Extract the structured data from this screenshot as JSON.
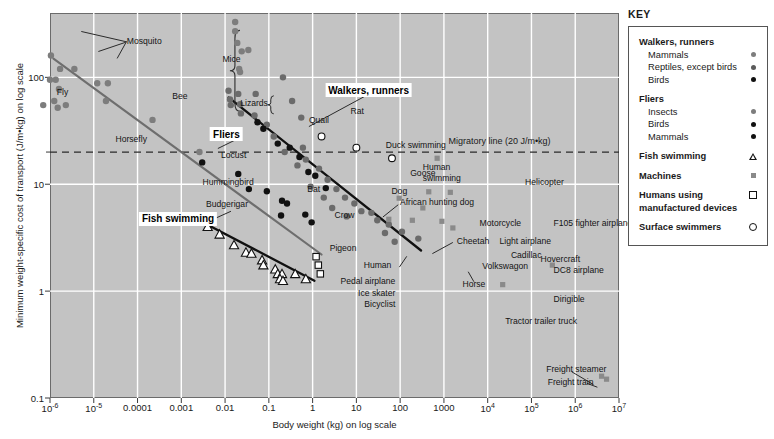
{
  "chart_data": {
    "type": "scatter",
    "title": "",
    "xlabel": "Body weight (kg) on log scale",
    "ylabel": "Minimum weight-specific cost of transport (J/m•kg) on log scale",
    "xscale": "log",
    "yscale": "log",
    "xlim": [
      1e-06,
      10000000.0
    ],
    "ylim": [
      0.1,
      400
    ],
    "grid": true,
    "legend_position": "right-outside",
    "xticks": [
      {
        "value": 1e-06,
        "label": "10",
        "exp": "-6"
      },
      {
        "value": 1e-05,
        "label": "10",
        "exp": "-5"
      },
      {
        "value": 0.0001,
        "label": "0.0001",
        "exp": ""
      },
      {
        "value": 0.001,
        "label": "0.001",
        "exp": ""
      },
      {
        "value": 0.01,
        "label": "0.01",
        "exp": ""
      },
      {
        "value": 0.1,
        "label": "0.1",
        "exp": ""
      },
      {
        "value": 1,
        "label": "1",
        "exp": ""
      },
      {
        "value": 10,
        "label": "10",
        "exp": ""
      },
      {
        "value": 100,
        "label": "100",
        "exp": ""
      },
      {
        "value": 1000,
        "label": "1000",
        "exp": ""
      },
      {
        "value": 10000,
        "label": "10",
        "exp": "4"
      },
      {
        "value": 100000,
        "label": "10",
        "exp": "5"
      },
      {
        "value": 1000000,
        "label": "10",
        "exp": "6"
      },
      {
        "value": 10000000,
        "label": "10",
        "exp": "7"
      }
    ],
    "yticks": [
      {
        "value": 100,
        "label": "100"
      },
      {
        "value": 10,
        "label": "10"
      },
      {
        "value": 1,
        "label": "1"
      },
      {
        "value": 0.1,
        "label": "0.1"
      }
    ],
    "reference_lines": [
      {
        "name": "migratory-line",
        "value": 20,
        "label": "Migratory line (20 J/m•kg)",
        "style": "dashed",
        "orientation": "horizontal"
      }
    ],
    "trend_lines": [
      {
        "name": "fliers",
        "label": "Fliers",
        "color": "#6e6e6e",
        "x": [
          1.2e-06,
          1.6
        ],
        "y": [
          150,
          2.2
        ]
      },
      {
        "name": "walkers-runners",
        "label": "Walkers, runners",
        "color": "#111111",
        "x": [
          0.012,
          300
        ],
        "y": [
          65,
          2.4
        ]
      },
      {
        "name": "fish-swimming",
        "label": "Fish swimming",
        "color": "#111111",
        "x": [
          0.0035,
          1.1
        ],
        "y": [
          4.3,
          1.25
        ]
      }
    ],
    "series": [
      {
        "name": "Fliers – insects",
        "symbol": "filled-circle-gray",
        "color": "#7d7d7d",
        "points": [
          [
            1.05e-06,
            160
          ],
          [
            1.7e-06,
            120
          ],
          [
            3.6e-06,
            120
          ],
          [
            1e-06,
            95
          ],
          [
            1.35e-06,
            95
          ],
          [
            1.6e-06,
            78
          ],
          [
            1.25e-06,
            60
          ],
          [
            1.5e-06,
            52
          ],
          [
            2.3e-06,
            55
          ],
          [
            7e-07,
            55
          ],
          [
            1.2e-05,
            88
          ],
          [
            2.1e-05,
            88
          ],
          [
            1.9e-05,
            60
          ],
          [
            0.00022,
            40
          ],
          [
            0.0026,
            20
          ]
        ]
      },
      {
        "name": "Fliers – birds",
        "symbol": "filled-circle-black",
        "color": "#111111",
        "points": [
          [
            0.003,
            16
          ],
          [
            0.035,
            9.0
          ],
          [
            0.09,
            8.6
          ],
          [
            0.2,
            7.0
          ],
          [
            0.26,
            6.6
          ],
          [
            0.19,
            5.1
          ],
          [
            0.68,
            5.2
          ],
          [
            0.95,
            4.4
          ]
        ]
      },
      {
        "name": "Fliers – mammals (bat)",
        "symbol": "filled-circle-black",
        "color": "#111111",
        "points": [
          [
            0.02,
            12.5
          ]
        ]
      },
      {
        "name": "Walkers/runners – mammals (mice cluster)",
        "symbol": "filled-circle-gray",
        "color": "#7d7d7d",
        "points": [
          [
            0.017,
            330
          ],
          [
            0.017,
            270
          ],
          [
            0.019,
            210
          ],
          [
            0.024,
            175
          ],
          [
            0.034,
            180
          ],
          [
            0.021,
            120
          ],
          [
            0.022,
            112
          ]
        ]
      },
      {
        "name": "Walkers/runners – reptiles/lizards",
        "symbol": "filled-circle-gray",
        "color": "#6b6b6b",
        "points": [
          [
            0.012,
            75
          ],
          [
            0.013,
            62
          ],
          [
            0.0135,
            55
          ],
          [
            0.02,
            70
          ],
          [
            0.022,
            56
          ],
          [
            0.023,
            46
          ],
          [
            0.05,
            70
          ],
          [
            0.047,
            44
          ],
          [
            0.09,
            36
          ],
          [
            0.21,
            100
          ],
          [
            0.34,
            60
          ],
          [
            0.13,
            28
          ],
          [
            0.55,
            42
          ],
          [
            0.23,
            20
          ],
          [
            0.6,
            22
          ],
          [
            0.7,
            17
          ],
          [
            1.4,
            14
          ],
          [
            0.9,
            9.5
          ],
          [
            2.2,
            11
          ],
          [
            3.5,
            9.0
          ],
          [
            5.5,
            7.5
          ],
          [
            9,
            6.6
          ],
          [
            13,
            5.6
          ],
          [
            30,
            4.6
          ],
          [
            55,
            4.2
          ],
          [
            110,
            3.6
          ],
          [
            260,
            3.1
          ],
          [
            0.45,
            15
          ],
          [
            1.8,
            7.5
          ],
          [
            6,
            5.0
          ],
          [
            22,
            5.4
          ],
          [
            2.8,
            6.0
          ],
          [
            45,
            3.5
          ],
          [
            75,
            2.9
          ]
        ]
      },
      {
        "name": "Walkers/runners – birds",
        "symbol": "filled-circle-black",
        "color": "#111111",
        "points": [
          [
            0.055,
            38
          ],
          [
            0.075,
            33
          ],
          [
            0.16,
            24
          ],
          [
            0.3,
            22
          ],
          [
            0.5,
            18
          ],
          [
            0.8,
            13
          ],
          [
            1.15,
            12
          ],
          [
            2.0,
            9.2
          ]
        ]
      },
      {
        "name": "Fish swimming",
        "symbol": "open-triangle",
        "color": "#111111",
        "points": [
          [
            0.004,
            4.0
          ],
          [
            0.0075,
            3.4
          ],
          [
            0.016,
            2.7
          ],
          [
            0.03,
            2.3
          ],
          [
            0.04,
            2.25
          ],
          [
            0.07,
            1.95
          ],
          [
            0.075,
            1.75
          ],
          [
            0.14,
            1.6
          ],
          [
            0.16,
            1.45
          ],
          [
            0.2,
            1.45
          ],
          [
            0.18,
            1.3
          ],
          [
            0.21,
            1.25
          ],
          [
            0.4,
            1.45
          ],
          [
            0.7,
            1.3
          ]
        ]
      },
      {
        "name": "Surface swimmers",
        "symbol": "open-circle",
        "color": "#111111",
        "points": [
          [
            1.6,
            28
          ],
          [
            10,
            22
          ],
          [
            65,
            17.5
          ]
        ]
      },
      {
        "name": "Humans using manufactured devices",
        "symbol": "open-square",
        "color": "#111111",
        "points": [
          [
            1.2,
            2.1
          ],
          [
            1.35,
            1.75
          ],
          [
            1.5,
            1.45
          ]
        ]
      },
      {
        "name": "Machines",
        "symbol": "filled-square-gray",
        "color": "#8a8a8a",
        "points": [
          [
            700,
            17.5
          ],
          [
            450,
            8.5
          ],
          [
            1400,
            8.4
          ],
          [
            95,
            7.4
          ],
          [
            330,
            6.0
          ],
          [
            190,
            4.6
          ],
          [
            900,
            4.5
          ],
          [
            1600,
            3.9
          ],
          [
            55,
            4.7
          ],
          [
            300000.0,
            1.75
          ],
          [
            22000.0,
            1.15
          ],
          [
            4000000.0,
            0.16
          ],
          [
            5200000.0,
            0.15
          ]
        ]
      }
    ],
    "point_labels": [
      {
        "name": "mosquito",
        "text": "Mosquito",
        "x": 0.135,
        "y": 0.072,
        "anchor": "l"
      },
      {
        "name": "fly",
        "text": "Fly",
        "x": 0.012,
        "y": 0.205,
        "anchor": "l"
      },
      {
        "name": "bee",
        "text": "Bee",
        "x": 0.215,
        "y": 0.215,
        "anchor": "l"
      },
      {
        "name": "horsefly",
        "text": "Horsefly",
        "x": 0.115,
        "y": 0.327,
        "anchor": "l"
      },
      {
        "name": "locust",
        "text": "Locust",
        "x": 0.345,
        "y": 0.368,
        "anchor": "r"
      },
      {
        "name": "hummingbird",
        "text": "Hummingbird",
        "x": 0.358,
        "y": 0.438,
        "anchor": "r"
      },
      {
        "name": "budgerigar",
        "text": "Budgerigar",
        "x": 0.348,
        "y": 0.497,
        "anchor": "r"
      },
      {
        "name": "bat",
        "text": "Bat",
        "x": 0.452,
        "y": 0.457,
        "anchor": "l"
      },
      {
        "name": "crow",
        "text": "Crow",
        "x": 0.5,
        "y": 0.525,
        "anchor": "l"
      },
      {
        "name": "pigeon",
        "text": "Pigeon",
        "x": 0.515,
        "y": 0.61,
        "anchor": "c"
      },
      {
        "name": "mice",
        "text": "Mice",
        "x": 0.335,
        "y": 0.12,
        "anchor": "r"
      },
      {
        "name": "lizards",
        "text": "Lizards",
        "x": 0.383,
        "y": 0.235,
        "anchor": "r"
      },
      {
        "name": "quail",
        "text": "Quail",
        "x": 0.455,
        "y": 0.277,
        "anchor": "l"
      },
      {
        "name": "rat",
        "text": "Rat",
        "x": 0.528,
        "y": 0.255,
        "anchor": "l"
      },
      {
        "name": "duck-swimming",
        "text": "Duck swimming",
        "x": 0.59,
        "y": 0.343,
        "anchor": "l"
      },
      {
        "name": "goose",
        "text": "Goose",
        "x": 0.633,
        "y": 0.415,
        "anchor": "l"
      },
      {
        "name": "dog",
        "text": "Dog",
        "x": 0.6,
        "y": 0.462,
        "anchor": "l"
      },
      {
        "name": "african-hunting-dog",
        "text": "African hunting dog",
        "x": 0.615,
        "y": 0.492,
        "anchor": "l"
      },
      {
        "name": "human-swimming-line1",
        "text": "Human",
        "x": 0.655,
        "y": 0.4,
        "anchor": "l"
      },
      {
        "name": "human-swimming-line2",
        "text": "swimming",
        "x": 0.655,
        "y": 0.428,
        "anchor": "l"
      },
      {
        "name": "cheetah",
        "text": "Cheetah",
        "x": 0.715,
        "y": 0.592,
        "anchor": "l"
      },
      {
        "name": "human",
        "text": "Human",
        "x": 0.6,
        "y": 0.655,
        "anchor": "r"
      },
      {
        "name": "horse",
        "text": "Horse",
        "x": 0.745,
        "y": 0.705,
        "anchor": "c"
      },
      {
        "name": "pedal-airplane",
        "text": "Pedal airplane",
        "x": 0.607,
        "y": 0.695,
        "anchor": "r"
      },
      {
        "name": "ice-skater",
        "text": "Ice skater",
        "x": 0.607,
        "y": 0.726,
        "anchor": "r"
      },
      {
        "name": "bicyclist",
        "text": "Bicyclist",
        "x": 0.607,
        "y": 0.757,
        "anchor": "r"
      },
      {
        "name": "helicopter",
        "text": "Helicopter",
        "x": 0.835,
        "y": 0.44,
        "anchor": "l"
      },
      {
        "name": "motorcycle",
        "text": "Motorcycle",
        "x": 0.755,
        "y": 0.545,
        "anchor": "l"
      },
      {
        "name": "f105",
        "text": "F105 fighter airplane",
        "x": 0.885,
        "y": 0.545,
        "anchor": "l"
      },
      {
        "name": "light-airplane",
        "text": "Light airplane",
        "x": 0.79,
        "y": 0.592,
        "anchor": "l"
      },
      {
        "name": "cadillac",
        "text": "Cadillac",
        "x": 0.81,
        "y": 0.628,
        "anchor": "l"
      },
      {
        "name": "volkswagon",
        "text": "Volkswagon",
        "x": 0.8,
        "y": 0.658,
        "anchor": "c"
      },
      {
        "name": "hovercraft",
        "text": "Hovercraft",
        "x": 0.862,
        "y": 0.638,
        "anchor": "l"
      },
      {
        "name": "dc8-airplane",
        "text": "DC8 airplane",
        "x": 0.885,
        "y": 0.668,
        "anchor": "l"
      },
      {
        "name": "dirigible",
        "text": "Dirigible",
        "x": 0.885,
        "y": 0.742,
        "anchor": "l"
      },
      {
        "name": "tractor-trailer-truck",
        "text": "Tractor trailer truck",
        "x": 0.8,
        "y": 0.8,
        "anchor": "l"
      },
      {
        "name": "freight-steamer",
        "text": "Freight steamer",
        "x": 0.925,
        "y": 0.925,
        "anchor": "c"
      },
      {
        "name": "freight-train",
        "text": "Freight train",
        "x": 0.915,
        "y": 0.958,
        "anchor": "c"
      }
    ],
    "callouts": [
      {
        "name": "walkers-runners-callout",
        "text": "Walkers, runners",
        "x": 0.56,
        "y": 0.2
      },
      {
        "name": "fliers-callout",
        "text": "Fliers",
        "x": 0.31,
        "y": 0.315
      },
      {
        "name": "fish-swimming-callout",
        "text": "Fish swimming",
        "x": 0.225,
        "y": 0.535
      }
    ]
  },
  "key": {
    "title": "KEY",
    "groups": [
      {
        "heading": "Walkers, runners",
        "items": [
          {
            "label": "Mammals",
            "symbol": "gray-dot"
          },
          {
            "label": "Reptiles, except birds",
            "symbol": "dark-gray-dot"
          },
          {
            "label": "Birds",
            "symbol": "black-dot"
          }
        ]
      },
      {
        "heading": "Fliers",
        "items": [
          {
            "label": "Insects",
            "symbol": "gray-dot"
          },
          {
            "label": "Birds",
            "symbol": "black-dot"
          },
          {
            "label": "Mammals",
            "symbol": "black-dot"
          }
        ]
      },
      {
        "heading": "Fish swimming",
        "symbol": "open-triangle",
        "items": []
      },
      {
        "heading": "Machines",
        "symbol": "gray-square",
        "bold": false,
        "items": []
      },
      {
        "heading": "Humans using manufactured devices",
        "symbol": "open-square",
        "items": []
      },
      {
        "heading": "Surface swimmers",
        "symbol": "open-circle",
        "items": []
      }
    ]
  },
  "colors": {
    "plot_background": "#c3c3c3",
    "gridline": "#ffffff",
    "fliers_line": "#6e6e6e",
    "walkers_line": "#111111",
    "fish_line": "#111111",
    "machine_symbol": "#8a8a8a",
    "mammal_symbol": "#7d7d7d",
    "bird_symbol": "#111111"
  }
}
